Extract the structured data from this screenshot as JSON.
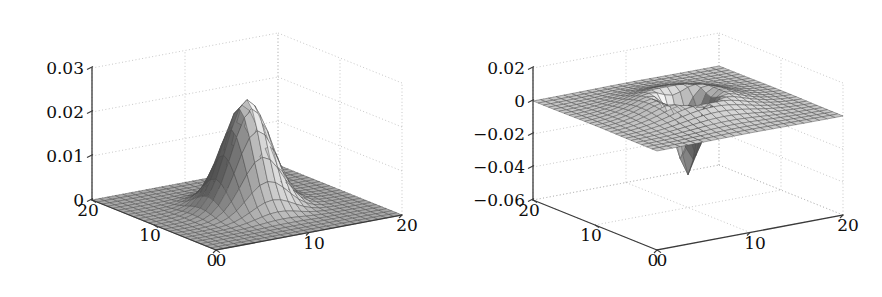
{
  "figure": {
    "background": "#ffffff",
    "line_color": "#3a3a3a",
    "grid_color": "#b9b9b9",
    "mesh_line_color": "#4a4a4a"
  },
  "chart_data": [
    {
      "id": "left",
      "type": "surface",
      "title": "",
      "xlabel": "",
      "ylabel": "",
      "zlabel": "",
      "grid": true,
      "legend": null,
      "projection": "3d",
      "surface_shape": "gaussian-peak",
      "colormap": "gray",
      "grid_size": [
        21,
        21
      ],
      "xlim": [
        0,
        20
      ],
      "ylim": [
        0,
        20
      ],
      "zlim": [
        0,
        0.03
      ],
      "x_ticks": [
        0,
        10,
        20
      ],
      "x_ticklabels": [
        "0",
        "10",
        "20"
      ],
      "y_ticks": [
        0,
        10,
        20
      ],
      "y_ticklabels": [
        "0",
        "10",
        "20"
      ],
      "z_ticks": [
        0,
        0.01,
        0.02,
        0.03
      ],
      "z_ticklabels": [
        "0",
        "0.01",
        "0.02",
        "0.03"
      ],
      "peak_value": 0.0245,
      "peak_location": [
        10,
        10
      ],
      "baseline_value": 0,
      "sigma": 2.2,
      "description": "Two-dimensional Gaussian bump centred at (10,10) rising from a flat zero plane to about 0.0245."
    },
    {
      "id": "right",
      "type": "surface",
      "title": "",
      "xlabel": "",
      "ylabel": "",
      "zlabel": "",
      "grid": true,
      "legend": null,
      "projection": "3d",
      "surface_shape": "mexican-hat-with-negative-spike",
      "colormap": "gray",
      "grid_size": [
        21,
        21
      ],
      "xlim": [
        0,
        20
      ],
      "ylim": [
        0,
        20
      ],
      "zlim": [
        -0.06,
        0.02
      ],
      "x_ticks": [
        0,
        10,
        20
      ],
      "x_ticklabels": [
        "0",
        "10",
        "20"
      ],
      "y_ticks": [
        0,
        10,
        20
      ],
      "y_ticklabels": [
        "0",
        "10",
        "20"
      ],
      "z_ticks": [
        -0.06,
        -0.04,
        -0.02,
        0,
        0.02
      ],
      "z_ticklabels": [
        "-0.06",
        "-0.04",
        "-0.02",
        "0",
        "0.02"
      ],
      "rim_value": 0.011,
      "rim_radius": 3.2,
      "trough_value": -0.055,
      "trough_location": [
        10,
        10
      ],
      "baseline_value": 0,
      "description": "Laplacian-of-Gaussian style crater: a raised annular rim around a deep narrow negative spike reaching about -0.055 at (10,10), flat at zero far from centre."
    }
  ]
}
